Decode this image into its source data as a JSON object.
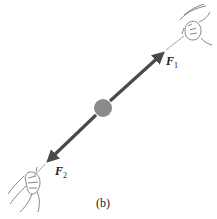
{
  "figure": {
    "caption": "(b)",
    "colors": {
      "arrow": "#4a4a4a",
      "ball": "#8a8a8a",
      "string": "#8f8f8f",
      "hand_line": "#555555"
    },
    "ball": {
      "cx": 103,
      "cy": 108,
      "r": 9
    },
    "forces": [
      {
        "id": "F1",
        "symbol": "F",
        "subscript": "1",
        "tip": [
          164,
          52
        ],
        "direction": "up-right"
      },
      {
        "id": "F2",
        "symbol": "F",
        "subscript": "2",
        "tip": [
          47,
          162
        ],
        "direction": "down-left"
      }
    ]
  }
}
